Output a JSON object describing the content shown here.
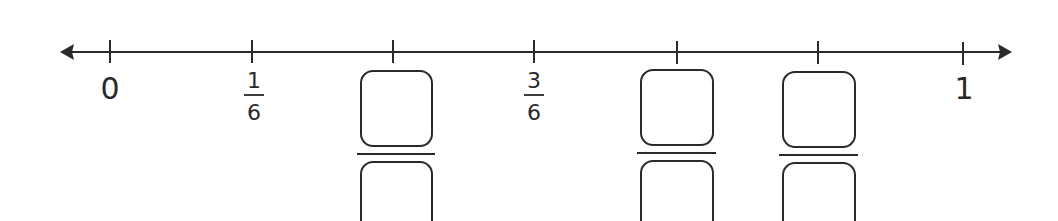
{
  "number_line": {
    "start_label": "0",
    "end_label": "1",
    "denominator": 6,
    "arrows": "both",
    "line_color": "#2a2a2a",
    "ticks": [
      {
        "position": 0,
        "label_type": "whole",
        "label": "0"
      },
      {
        "position": 1,
        "label_type": "fraction",
        "numerator": "1",
        "denominator": "6"
      },
      {
        "position": 2,
        "label_type": "blank_fraction"
      },
      {
        "position": 3,
        "label_type": "fraction",
        "numerator": "3",
        "denominator": "6"
      },
      {
        "position": 4,
        "label_type": "blank_fraction"
      },
      {
        "position": 5,
        "label_type": "blank_fraction"
      },
      {
        "position": 6,
        "label_type": "whole",
        "label": "1"
      }
    ]
  },
  "labels": {
    "zero": "0",
    "one": "1",
    "one_sixth_num": "1",
    "one_sixth_den": "6",
    "three_sixths_num": "3",
    "three_sixths_den": "6"
  }
}
